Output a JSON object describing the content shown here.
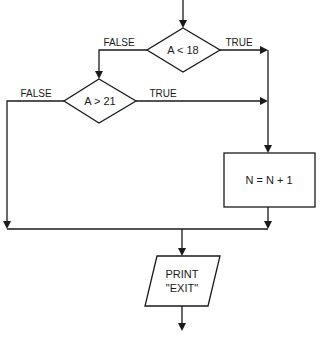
{
  "diagram": {
    "type": "flowchart",
    "nodes": {
      "decision1": {
        "shape": "diamond",
        "text": "A < 18"
      },
      "decision2": {
        "shape": "diamond",
        "text": "A > 21"
      },
      "process1": {
        "shape": "rectangle",
        "text": "N = N + 1"
      },
      "output1": {
        "shape": "parallelogram",
        "line1": "PRINT",
        "line2": "\"EXIT\""
      }
    },
    "edges": {
      "d1_false": {
        "from": "decision1",
        "to": "decision2",
        "label": "FALSE"
      },
      "d1_true": {
        "from": "decision1",
        "to": "process1",
        "label": "TRUE"
      },
      "d2_false": {
        "from": "decision2",
        "to": "output1",
        "label": "FALSE"
      },
      "d2_true": {
        "from": "decision2",
        "to": "process1",
        "label": "TRUE"
      },
      "p1_out": {
        "from": "process1",
        "to": "output1",
        "label": ""
      }
    }
  }
}
